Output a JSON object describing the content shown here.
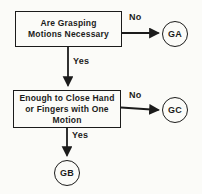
{
  "colors": {
    "background": "#fbfbf8",
    "ink": "#1b1b1b"
  },
  "diagram": {
    "decision1": {
      "line1": "Are Grasping",
      "line2": "Motions Necessary"
    },
    "decision2": {
      "line1": "Enough to Close Hand",
      "line2": "or Fingers with One",
      "line3": "Motion"
    },
    "edge_labels": {
      "no1": "No",
      "yes1": "Yes",
      "no2": "No",
      "yes2": "Yes"
    },
    "terminals": {
      "ga": "GA",
      "gc": "GC",
      "gb": "GB"
    }
  }
}
